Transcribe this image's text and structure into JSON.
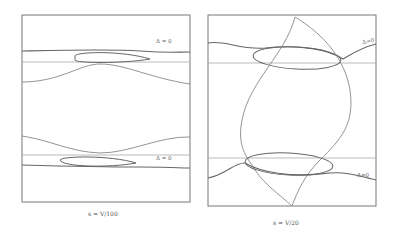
{
  "figure": {
    "panels": [
      {
        "id": "left",
        "caption": "s = V/100",
        "labels": [
          {
            "text": "Δ = 0",
            "x": 156,
            "y": 43
          },
          {
            "text": "Δ = 0",
            "x": 156,
            "y": 158
          }
        ]
      },
      {
        "id": "right",
        "caption": "s = V/20",
        "labels": [
          {
            "text": "Δ=0",
            "x": 363,
            "y": 41
          },
          {
            "text": "Δ=0",
            "x": 358,
            "y": 174
          }
        ]
      }
    ],
    "colors": {
      "frame": "#777777",
      "curve_dark": "#666666",
      "curve_light": "#999999",
      "background": "#ffffff"
    }
  }
}
